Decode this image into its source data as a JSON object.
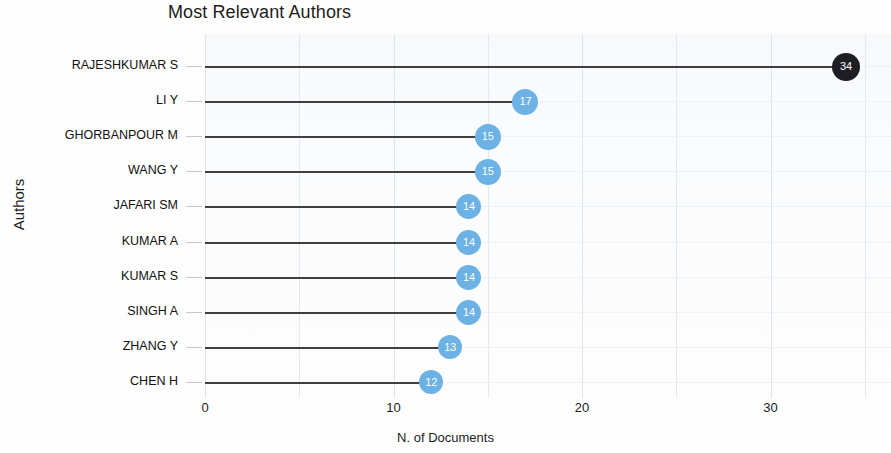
{
  "chart_data": {
    "type": "scatter",
    "title": "Most Relevant Authors",
    "xlabel": "N. of Documents",
    "ylabel": "Authors",
    "categories": [
      "RAJESHKUMAR S",
      "LI Y",
      "GHORBANPOUR M",
      "WANG Y",
      "JAFARI SM",
      "KUMAR A",
      "KUMAR S",
      "SINGH A",
      "ZHANG Y",
      "CHEN H"
    ],
    "values": [
      34,
      17,
      15,
      15,
      14,
      14,
      14,
      14,
      13,
      12
    ],
    "xlim": [
      0,
      36.3
    ],
    "xticks": [
      0,
      10,
      20,
      30
    ],
    "xtick_labels": [
      "0",
      "10",
      "20",
      "30"
    ],
    "gridlines_x": [
      0,
      5,
      10,
      15,
      20,
      25,
      30,
      35
    ],
    "grid": true,
    "legend": "none",
    "point_colors": [
      "#1d1d24",
      "#6cb2e4",
      "#6cb2e4",
      "#6cb2e4",
      "#6cb2e4",
      "#6cb2e4",
      "#6cb2e4",
      "#6cb2e4",
      "#6cb2e4",
      "#6cb2e4"
    ],
    "point_labels": [
      "34",
      "17",
      "15",
      "15",
      "14",
      "14",
      "14",
      "14",
      "13",
      "12"
    ],
    "point_radius_px": [
      14,
      13,
      13,
      13,
      12.5,
      12.5,
      12.5,
      12.5,
      12,
      12
    ],
    "stem_color": "#3f3f3f",
    "grid_color": "#e3e9ef",
    "accent_color": "#6cb2e4",
    "highlight_color": "#1d1d24"
  }
}
